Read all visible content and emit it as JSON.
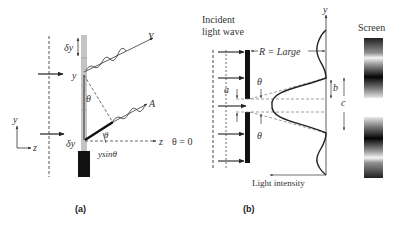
{
  "panel_a": {
    "caption": "(a)",
    "labels": {
      "delta_y_top": "δy",
      "y_point": "y",
      "theta_mid": "θ",
      "theta_low": "θ",
      "delta_y_bottom": "δy",
      "y_sin_theta": "ysinθ",
      "ray_Y": "Y",
      "ray_A": "A",
      "z_axis": "z",
      "theta_zero": "θ = 0",
      "axes_y": "y",
      "axes_z": "z"
    }
  },
  "panel_b": {
    "caption": "(b)",
    "labels": {
      "incident_line1": "Incident",
      "incident_line2": "light wave",
      "r_large": "R = Large",
      "y_axis": "y",
      "theta_top": "θ",
      "theta_bottom": "θ",
      "a": "a",
      "b": "b",
      "c": "c",
      "light_intensity": "Light intensity",
      "screen": "Screen"
    }
  },
  "colors": {
    "ink": "#222222",
    "slit_gray": "#bdbdbd",
    "dashed": "#555555"
  }
}
